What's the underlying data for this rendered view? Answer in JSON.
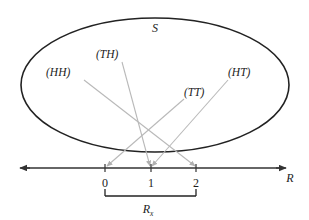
{
  "figure": {
    "title_symbol": "S",
    "sample_space": {
      "name": "sample-space-ellipse",
      "label": "S",
      "cx": 155,
      "cy": 85,
      "rx": 134,
      "ry": 67,
      "stroke": "#222222"
    },
    "outcomes": [
      {
        "id": "HH",
        "label": "(HH)",
        "x": 46,
        "y": 76,
        "arrow_from": [
          84,
          80
        ],
        "arrow_to": [
          195,
          166
        ]
      },
      {
        "id": "TH",
        "label": "(TH)",
        "x": 96,
        "y": 58,
        "arrow_from": [
          122,
          62
        ],
        "arrow_to": [
          150,
          166
        ]
      },
      {
        "id": "TT",
        "label": "(TT)",
        "x": 184,
        "y": 96,
        "arrow_from": [
          184,
          99
        ],
        "arrow_to": [
          107,
          166
        ]
      },
      {
        "id": "HT",
        "label": "(HT)",
        "x": 228,
        "y": 76,
        "arrow_from": [
          228,
          80
        ],
        "arrow_to": [
          152,
          166
        ]
      }
    ],
    "arrow_color": "#b9b9b9",
    "axis": {
      "name": "real-line",
      "label": "R",
      "y": 168,
      "x_start": 18,
      "x_end": 288,
      "stroke": "#333333",
      "label_x": 291,
      "label_y": 180,
      "ticks": [
        {
          "value": "0",
          "x": 105
        },
        {
          "value": "1",
          "x": 151
        },
        {
          "value": "2",
          "x": 196
        }
      ],
      "tick_label_y": 186
    },
    "bracket": {
      "name": "range-bracket",
      "label_main": "R",
      "label_sub": "x",
      "x_left": 105,
      "x_right": 196,
      "y": 196,
      "tick_height": 7,
      "label_x": 148,
      "label_y": 213,
      "stroke": "#222222"
    }
  }
}
